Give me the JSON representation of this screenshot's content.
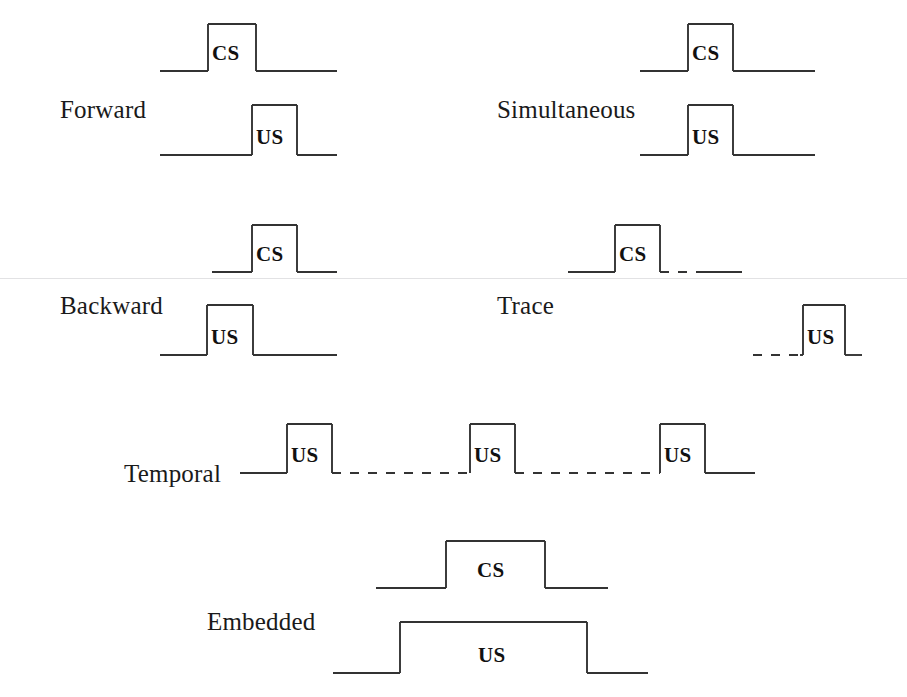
{
  "figure": {
    "background_color": "#ffffff",
    "line_color": "#333333",
    "text_color": "#1a1a1a",
    "width": 907,
    "height": 697
  },
  "chart_data": {
    "type": "line",
    "xlabel": "Time",
    "ylabel": "Stimulus on/off",
    "grid": false,
    "legend": "none",
    "paradigms": [
      {
        "name": "Forward",
        "label": "Forward",
        "label_x": 60,
        "label_y": 96,
        "traces": [
          {
            "stimulus": "CS",
            "label": "CS",
            "baseline_y": 71,
            "top_y": 24,
            "line_start_x": 160,
            "line_end_x": 337,
            "pulse_start_x": 208,
            "pulse_end_x": 256,
            "label_x": 212,
            "label_y": 60,
            "lead_dashed": false,
            "trail_dashed": false
          },
          {
            "stimulus": "US",
            "label": "US",
            "baseline_y": 155,
            "top_y": 105,
            "line_start_x": 160,
            "line_end_x": 337,
            "pulse_start_x": 252,
            "pulse_end_x": 297,
            "label_x": 256,
            "label_y": 144,
            "lead_dashed": false,
            "trail_dashed": false
          }
        ]
      },
      {
        "name": "Simultaneous",
        "label": "Simultaneous",
        "label_x": 497,
        "label_y": 96,
        "traces": [
          {
            "stimulus": "CS",
            "label": "CS",
            "baseline_y": 71,
            "top_y": 24,
            "line_start_x": 640,
            "line_end_x": 815,
            "pulse_start_x": 688,
            "pulse_end_x": 733,
            "label_x": 692,
            "label_y": 60,
            "lead_dashed": false,
            "trail_dashed": false
          },
          {
            "stimulus": "US",
            "label": "US",
            "baseline_y": 155,
            "top_y": 105,
            "line_start_x": 640,
            "line_end_x": 815,
            "pulse_start_x": 688,
            "pulse_end_x": 733,
            "label_x": 692,
            "label_y": 144,
            "lead_dashed": false,
            "trail_dashed": false
          }
        ]
      },
      {
        "name": "Backward",
        "label": "Backward",
        "label_x": 60,
        "label_y": 292,
        "traces": [
          {
            "stimulus": "CS",
            "label": "CS",
            "baseline_y": 272,
            "top_y": 225,
            "line_start_x": 212,
            "line_end_x": 337,
            "pulse_start_x": 252,
            "pulse_end_x": 297,
            "label_x": 256,
            "label_y": 261,
            "lead_dashed": false,
            "trail_dashed": false
          },
          {
            "stimulus": "US",
            "label": "US",
            "baseline_y": 355,
            "top_y": 305,
            "line_start_x": 160,
            "line_end_x": 337,
            "pulse_start_x": 207,
            "pulse_end_x": 253,
            "label_x": 211,
            "label_y": 344,
            "lead_dashed": false,
            "trail_dashed": false
          }
        ]
      },
      {
        "name": "Trace",
        "label": "Trace",
        "label_x": 497,
        "label_y": 292,
        "traces": [
          {
            "stimulus": "CS",
            "label": "CS",
            "baseline_y": 272,
            "top_y": 225,
            "line_start_x": 568,
            "line_end_x": 742,
            "pulse_start_x": 615,
            "pulse_end_x": 660,
            "label_x": 619,
            "label_y": 261,
            "lead_dashed": false,
            "trail_dashed": true,
            "trail_dash_end_x": 700
          },
          {
            "stimulus": "US",
            "label": "US",
            "baseline_y": 355,
            "top_y": 305,
            "line_start_x": 753,
            "line_end_x": 862,
            "pulse_start_x": 803,
            "pulse_end_x": 845,
            "label_x": 807,
            "label_y": 344,
            "lead_dashed": true,
            "lead_dash_end_x": 800,
            "trail_dashed": false
          }
        ]
      },
      {
        "name": "Temporal",
        "label": "Temporal",
        "label_x": 124,
        "label_y": 460,
        "traces": [
          {
            "stimulus": "US",
            "label": "US",
            "baseline_y": 473,
            "top_y": 424,
            "line_start_x": 240,
            "line_end_x": 755,
            "pulse_start_x": 287,
            "pulse_end_x": 332,
            "label_x": 291,
            "label_y": 462,
            "lead_dashed": false,
            "trail_dashed": false,
            "multi": true
          }
        ],
        "pulse_train": {
          "baseline_y": 473,
          "top_y": 424,
          "line_start_x": 240,
          "line_end_x": 755,
          "pulses": [
            {
              "start_x": 287,
              "end_x": 332,
              "label": "US",
              "label_x": 291,
              "label_y": 462
            },
            {
              "start_x": 470,
              "end_x": 515,
              "label": "US",
              "label_x": 474,
              "label_y": 462
            },
            {
              "start_x": 660,
              "end_x": 705,
              "label": "US",
              "label_x": 664,
              "label_y": 462
            }
          ],
          "dashed_gaps": [
            {
              "start_x": 332,
              "end_x": 470
            },
            {
              "start_x": 515,
              "end_x": 660
            }
          ]
        }
      },
      {
        "name": "Embedded",
        "label": "Embedded",
        "label_x": 207,
        "label_y": 608,
        "traces": [
          {
            "stimulus": "CS",
            "label": "CS",
            "baseline_y": 588,
            "top_y": 541,
            "line_start_x": 376,
            "line_end_x": 608,
            "pulse_start_x": 446,
            "pulse_end_x": 545,
            "label_x": 477,
            "label_y": 577,
            "lead_dashed": false,
            "trail_dashed": false
          },
          {
            "stimulus": "US",
            "label": "US",
            "baseline_y": 673,
            "top_y": 622,
            "line_start_x": 333,
            "line_end_x": 648,
            "pulse_start_x": 400,
            "pulse_end_x": 587,
            "label_x": 478,
            "label_y": 662,
            "lead_dashed": false,
            "trail_dashed": false
          }
        ]
      }
    ]
  },
  "artifacts": {
    "scanlines": [
      {
        "y": 278,
        "x": 0,
        "width": 907
      }
    ]
  }
}
